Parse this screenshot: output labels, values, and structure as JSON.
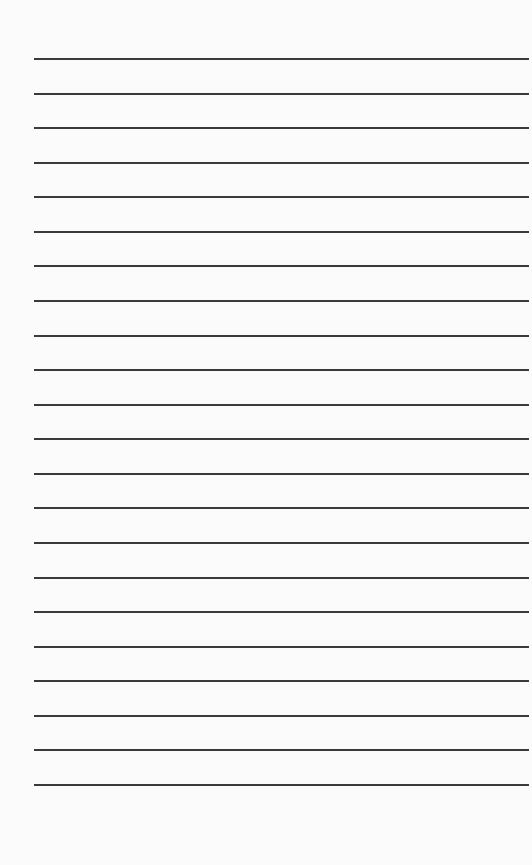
{
  "page": {
    "type": "lined-paper",
    "background": "#fbfbfb",
    "line_color": "#3a3a3a",
    "line_count": 22,
    "first_line_y": 58,
    "line_spacing": 34.57,
    "line_left": 34,
    "line_right": 529,
    "lines": [
      "",
      "",
      "",
      "",
      "",
      "",
      "",
      "",
      "",
      "",
      "",
      "",
      "",
      "",
      "",
      "",
      "",
      "",
      "",
      "",
      "",
      ""
    ]
  }
}
